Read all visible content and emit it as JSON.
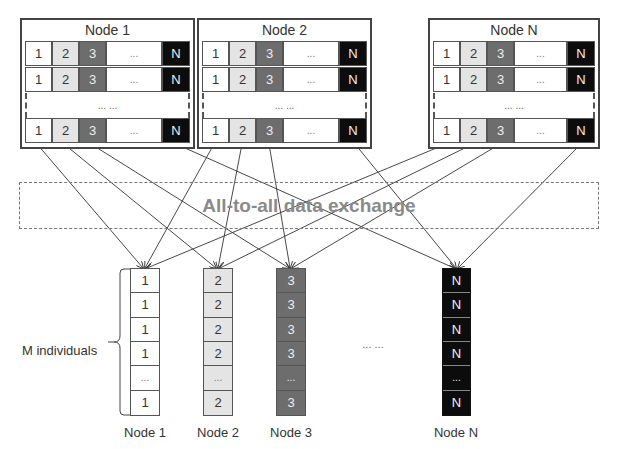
{
  "top_nodes": [
    {
      "title": "Node 1",
      "cells": [
        "1",
        "2",
        "3",
        "...",
        "N"
      ],
      "gap_label": "... ..."
    },
    {
      "title": "Node 2",
      "cells": [
        "1",
        "2",
        "3",
        "...",
        "N"
      ],
      "gap_label": "... ..."
    },
    {
      "title": "Node N",
      "cells": [
        "1",
        "2",
        "3",
        "...",
        "N"
      ],
      "gap_label": "... ..."
    }
  ],
  "exchange": {
    "label": "All-to-all data exchange"
  },
  "bottom_columns": [
    {
      "label": "Node 1",
      "cells": [
        "1",
        "1",
        "1",
        "1",
        "...",
        "1"
      ]
    },
    {
      "label": "Node 2",
      "cells": [
        "2",
        "2",
        "2",
        "2",
        "...",
        "2"
      ]
    },
    {
      "label": "Node 3",
      "cells": [
        "3",
        "3",
        "3",
        "3",
        "...",
        "3"
      ]
    },
    {
      "label": "Node N",
      "cells": [
        "N",
        "N",
        "N",
        "N",
        "...",
        "N"
      ]
    }
  ],
  "between_columns_label": "... ...",
  "brace_label": "M individuals",
  "colors": {
    "slot1": "#ffffff",
    "slot2": "#e4e4e4",
    "slot3": "#6d6d6d",
    "slotN": "#0c0c0c",
    "exchange_text": "#8a8a8a"
  }
}
